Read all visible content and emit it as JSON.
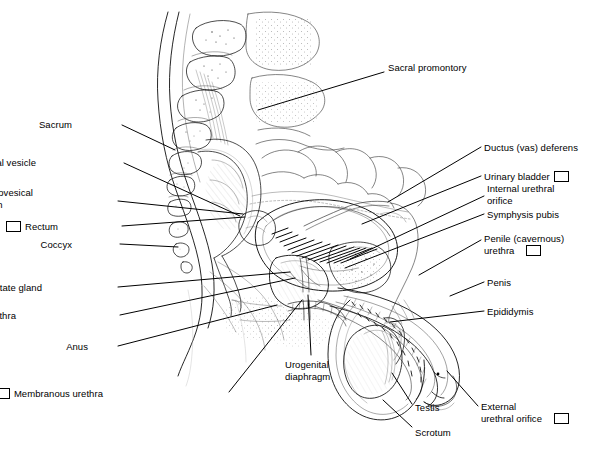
{
  "figure": {
    "background_color": "#ffffff",
    "ink_color": "#000000",
    "line_color": "#000000"
  },
  "labels": [
    {
      "id": "sacral-promontory",
      "text": "Sacral promontory",
      "checkbox": false,
      "side": "right",
      "x": 388,
      "y": 62,
      "leader": [
        [
          384,
          72
        ],
        [
          258,
          110
        ]
      ]
    },
    {
      "id": "sacrum",
      "text": "Sacrum",
      "checkbox": false,
      "side": "left",
      "x": 72,
      "y": 119,
      "leader": [
        [
          122,
          125
        ],
        [
          175,
          150
        ]
      ]
    },
    {
      "id": "seminal-vesicle",
      "text": "Seminal vesicle",
      "checkbox": false,
      "side": "left",
      "x": 36,
      "y": 157,
      "leader": [
        [
          124,
          163
        ],
        [
          240,
          216
        ]
      ]
    },
    {
      "id": "rectovesical-pouch",
      "text": "Rectovesical\npouch",
      "text_line1": "Rectovesical",
      "text_line2": "pouch",
      "checkbox": true,
      "side": "left",
      "x": 33,
      "y": 187,
      "leader": [
        [
          118,
          201
        ],
        [
          243,
          214
        ]
      ]
    },
    {
      "id": "rectum",
      "text": "Rectum",
      "checkbox": true,
      "side": "left",
      "x": 58,
      "y": 221,
      "leader": [
        [
          122,
          226
        ],
        [
          245,
          217
        ]
      ]
    },
    {
      "id": "coccyx",
      "text": "Coccyx",
      "checkbox": false,
      "side": "left",
      "x": 72,
      "y": 239,
      "leader": [
        [
          120,
          244
        ],
        [
          178,
          247
        ]
      ]
    },
    {
      "id": "prostate-gland",
      "text": "Prostate gland",
      "checkbox": false,
      "side": "left",
      "x": 42,
      "y": 282,
      "leader": [
        [
          118,
          287
        ],
        [
          290,
          272
        ]
      ]
    },
    {
      "id": "prostatic-urethra",
      "text": "Prostatic urethra",
      "checkbox": true,
      "side": "left",
      "x": 16,
      "y": 310,
      "leader": [
        [
          120,
          315
        ],
        [
          295,
          278
        ]
      ]
    },
    {
      "id": "anus",
      "text": "Anus",
      "checkbox": false,
      "side": "left",
      "x": 88,
      "y": 341,
      "leader": [
        [
          118,
          346
        ],
        [
          277,
          305
        ]
      ]
    },
    {
      "id": "membranous-urethra",
      "text": "Membranous urethra",
      "checkbox": true,
      "side": "left",
      "x": 103,
      "y": 388,
      "leader": [
        [
          229,
          392
        ],
        [
          302,
          300
        ]
      ]
    },
    {
      "id": "urogenital-diaphragm",
      "text": "Urogenital\ndiaphragm",
      "text_line1": "Urogenital",
      "text_line2": "diaphragm",
      "checkbox": false,
      "side": "center",
      "x": 285,
      "y": 359,
      "leader": [
        [
          311,
          355
        ],
        [
          308,
          295
        ]
      ]
    },
    {
      "id": "ductus-vas-deferens",
      "text": "Ductus (vas) deferens",
      "checkbox": false,
      "side": "right",
      "x": 484,
      "y": 142,
      "leader": [
        [
          481,
          147
        ],
        [
          388,
          202
        ]
      ]
    },
    {
      "id": "urinary-bladder",
      "text": "Urinary bladder",
      "checkbox": true,
      "side": "right",
      "x": 484,
      "y": 171,
      "leader": [
        [
          481,
          176
        ],
        [
          362,
          224
        ]
      ]
    },
    {
      "id": "internal-urethral-orifice",
      "text": "Internal urethral\norifice",
      "text_line1": "Internal urethral",
      "text_line2": "orifice",
      "checkbox": false,
      "side": "right",
      "x": 487,
      "y": 183,
      "leader": [
        [
          484,
          196
        ],
        [
          350,
          259
        ]
      ]
    },
    {
      "id": "symphysis-pubis",
      "text": "Symphysis pubis",
      "checkbox": false,
      "side": "right",
      "x": 487,
      "y": 209,
      "leader": [
        [
          484,
          214
        ],
        [
          345,
          268
        ]
      ]
    },
    {
      "id": "penile-cavernous-urethra",
      "text": "Penile (cavernous)\nurethra",
      "text_line1": "Penile (cavernous)",
      "text_line2": "urethra",
      "checkbox": true,
      "side": "right",
      "x": 484,
      "y": 233,
      "leader": [
        [
          481,
          240
        ],
        [
          419,
          275
        ]
      ]
    },
    {
      "id": "penis",
      "text": "Penis",
      "checkbox": false,
      "side": "right",
      "x": 487,
      "y": 277,
      "leader": [
        [
          484,
          282
        ],
        [
          450,
          296
        ]
      ]
    },
    {
      "id": "epididymis",
      "text": "Epididymis",
      "checkbox": false,
      "side": "right",
      "x": 487,
      "y": 306,
      "leader": [
        [
          484,
          311
        ],
        [
          390,
          322
        ]
      ]
    },
    {
      "id": "testis",
      "text": "Testis",
      "checkbox": false,
      "side": "right",
      "x": 415,
      "y": 402,
      "leader": [
        [
          412,
          404
        ],
        [
          392,
          373
        ]
      ]
    },
    {
      "id": "scrotum",
      "text": "Scrotum",
      "checkbox": false,
      "side": "right",
      "x": 415,
      "y": 427,
      "leader": [
        [
          412,
          427
        ],
        [
          383,
          400
        ]
      ]
    },
    {
      "id": "external-urethral-orifice",
      "text": "External\nurethral orifice",
      "text_line1": "External",
      "text_line2": "urethral orifice",
      "checkbox": true,
      "side": "right",
      "x": 481,
      "y": 401,
      "leader": [
        [
          478,
          406
        ],
        [
          447,
          371
        ]
      ]
    }
  ]
}
